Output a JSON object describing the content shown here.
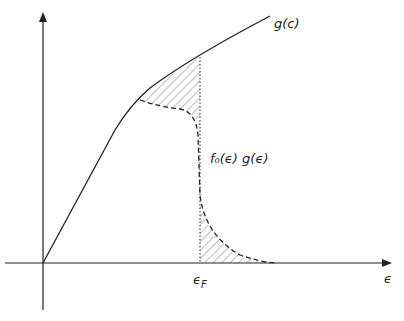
{
  "diagram": {
    "type": "density-of-states-sketch",
    "curve_label": "g(c)",
    "product_label": "f₀(ϵ) g(ϵ)",
    "fermi_label": "ϵF",
    "x_axis_label": "ϵ",
    "colors": {
      "ink": "#222222",
      "hatch": "#555555"
    }
  }
}
